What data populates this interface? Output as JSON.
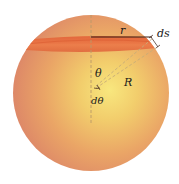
{
  "figure": {
    "labels": {
      "r": "r",
      "ds": "ds",
      "theta": "θ",
      "R": "R",
      "dtheta": "dθ"
    },
    "colors": {
      "sphere_highlight": "#f7e27a",
      "sphere_mid": "#efb462",
      "sphere_edge": "#de8a68",
      "band": "#e86a3a",
      "band_dark": "#d9532b",
      "line": "#3a1e14",
      "dashed": "#b99a6a"
    }
  }
}
